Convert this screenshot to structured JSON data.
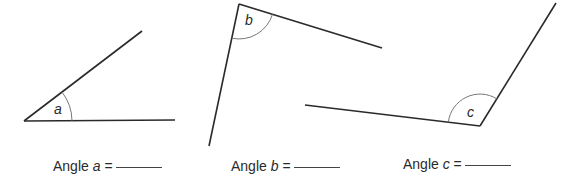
{
  "angles": [
    {
      "id": "a",
      "label_prefix": "Angle ",
      "var": "a",
      "equals": " =",
      "vertex": [
        24,
        121
      ],
      "arms": [
        [
          175,
          120
        ],
        [
          142,
          31
        ]
      ],
      "arc_radius": 48
    },
    {
      "id": "b",
      "label_prefix": "Angle ",
      "var": "b",
      "equals": " =",
      "vertex": [
        239,
        4
      ],
      "arms": [
        [
          382,
          48
        ],
        [
          209,
          146
        ]
      ],
      "arc_radius": 35
    },
    {
      "id": "c",
      "label_prefix": "Angle ",
      "var": "c",
      "equals": " =",
      "vertex": [
        480,
        126
      ],
      "arms": [
        [
          305,
          105
        ],
        [
          556,
          3
        ]
      ],
      "arc_radius": 32
    }
  ],
  "colors": {
    "line": "#2a2a2a",
    "arc": "#777777",
    "text": "#2a2a2a"
  }
}
